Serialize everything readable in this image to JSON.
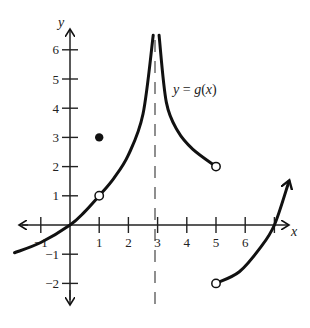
{
  "chart_data": {
    "type": "line",
    "title": "",
    "function_label": "y = g(x)",
    "function_label_parts": {
      "y": "y",
      "eq": " = ",
      "g": "g",
      "open": "(",
      "x": "x",
      "close": ")"
    },
    "xlabel": "x",
    "ylabel": "y",
    "xlim": [
      -2,
      8
    ],
    "ylim": [
      -2.5,
      6.5
    ],
    "x_ticks": [
      -1,
      1,
      2,
      3,
      4,
      5,
      6,
      7
    ],
    "x_tick_labels": [
      "-1",
      "1",
      "2",
      "3",
      "4",
      "5",
      "6",
      ""
    ],
    "y_ticks": [
      -2,
      -1,
      1,
      2,
      3,
      4,
      5,
      6
    ],
    "y_tick_labels": [
      "-2",
      "-1",
      "1",
      "2",
      "3",
      "4",
      "5",
      "6"
    ],
    "vertical_asymptote": {
      "x": 3,
      "style": "dashed"
    },
    "segments": [
      {
        "name": "left-branch",
        "x_range": [
          -2,
          1
        ],
        "end_open": true,
        "start_arrow": false,
        "points": [
          [
            -1.9,
            -0.95
          ],
          [
            -1,
            -0.6
          ],
          [
            0,
            0
          ],
          [
            0.5,
            0.45
          ],
          [
            1,
            1
          ]
        ]
      },
      {
        "name": "rising-to-asymptote",
        "x_range": [
          1,
          3
        ],
        "points": [
          [
            1,
            1
          ],
          [
            1.5,
            1.6
          ],
          [
            2,
            2.4
          ],
          [
            2.5,
            3.8
          ],
          [
            2.85,
            6.5
          ]
        ]
      },
      {
        "name": "falling-from-asymptote",
        "x_range": [
          3,
          5
        ],
        "end_open": true,
        "points": [
          [
            3.05,
            6.5
          ],
          [
            3.3,
            4.2
          ],
          [
            3.7,
            3.2
          ],
          [
            4.2,
            2.6
          ],
          [
            5,
            2
          ]
        ]
      },
      {
        "name": "right-branch",
        "x_range": [
          5,
          7.5
        ],
        "start_open": true,
        "end_arrow": true,
        "points": [
          [
            5,
            -2
          ],
          [
            5.8,
            -1.6
          ],
          [
            6.5,
            -0.8
          ],
          [
            7,
            0
          ],
          [
            7.5,
            1.5
          ]
        ]
      }
    ],
    "open_points": [
      [
        1,
        1
      ],
      [
        5,
        2
      ],
      [
        5,
        -2
      ]
    ],
    "closed_points": [
      [
        1,
        3
      ]
    ],
    "grid": false
  }
}
